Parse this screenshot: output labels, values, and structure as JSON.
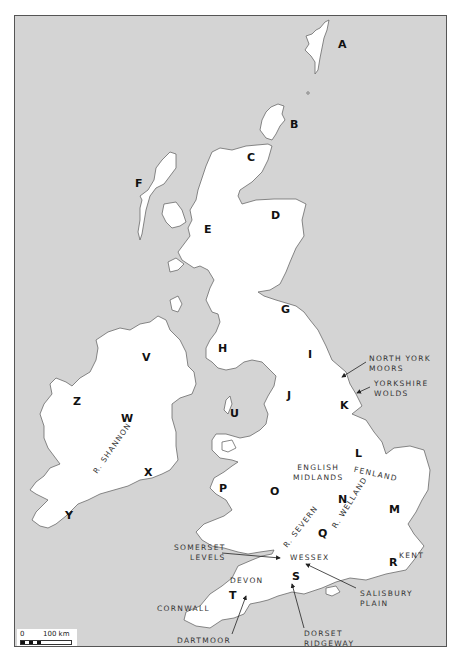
{
  "map": {
    "background_color": "#d4d4d4",
    "land_color": "#ffffff",
    "region_labels": [
      {
        "id": "A",
        "x": 338,
        "y": 44
      },
      {
        "id": "B",
        "x": 290,
        "y": 124
      },
      {
        "id": "C",
        "x": 247,
        "y": 157
      },
      {
        "id": "D",
        "x": 271,
        "y": 215
      },
      {
        "id": "E",
        "x": 204,
        "y": 229
      },
      {
        "id": "F",
        "x": 135,
        "y": 183
      },
      {
        "id": "G",
        "x": 281,
        "y": 304
      },
      {
        "id": "H",
        "x": 218,
        "y": 341
      },
      {
        "id": "I",
        "x": 308,
        "y": 350
      },
      {
        "id": "J",
        "x": 287,
        "y": 389
      },
      {
        "id": "K",
        "x": 340,
        "y": 398
      },
      {
        "id": "L",
        "x": 355,
        "y": 449
      },
      {
        "id": "M",
        "x": 389,
        "y": 504
      },
      {
        "id": "N",
        "x": 338,
        "y": 494
      },
      {
        "id": "O",
        "x": 270,
        "y": 486
      },
      {
        "id": "P",
        "x": 219,
        "y": 483
      },
      {
        "id": "Q",
        "x": 318,
        "y": 528
      },
      {
        "id": "R",
        "x": 389,
        "y": 556
      },
      {
        "id": "S",
        "x": 292,
        "y": 571
      },
      {
        "id": "T",
        "x": 229,
        "y": 590
      },
      {
        "id": "U",
        "x": 230,
        "y": 408
      },
      {
        "id": "V",
        "x": 142,
        "y": 353
      },
      {
        "id": "W",
        "x": 121,
        "y": 413
      },
      {
        "id": "X",
        "x": 144,
        "y": 467
      },
      {
        "id": "Y",
        "x": 65,
        "y": 511
      },
      {
        "id": "Z",
        "x": 73,
        "y": 396
      }
    ],
    "place_labels": [
      {
        "text_lines": [
          "NORTH YORK",
          "MOORS"
        ],
        "x": 369,
        "y": 354
      },
      {
        "text_lines": [
          "YORKSHIRE",
          "WOLDS"
        ],
        "x": 374,
        "y": 379
      },
      {
        "text_lines": [
          "ENGLISH",
          "MIDLANDS"
        ],
        "x": 293,
        "y": 463
      },
      {
        "text_lines": [
          "FENLAND"
        ],
        "x": 355,
        "y": 466
      },
      {
        "text_lines": [
          "SOMERSET",
          "LEVELS"
        ],
        "x": 174,
        "y": 543
      },
      {
        "text_lines": [
          "WESSEX"
        ],
        "x": 290,
        "y": 553
      },
      {
        "text_lines": [
          "KENT"
        ],
        "x": 399,
        "y": 551
      },
      {
        "text_lines": [
          "DEVON"
        ],
        "x": 230,
        "y": 576
      },
      {
        "text_lines": [
          "SALISBURY",
          "PLAIN"
        ],
        "x": 360,
        "y": 589
      },
      {
        "text_lines": [
          "CORNWALL"
        ],
        "x": 157,
        "y": 604
      },
      {
        "text_lines": [
          "DARTMOOR"
        ],
        "x": 177,
        "y": 636
      },
      {
        "text_lines": [
          "DORSET",
          "RIDGEWAY"
        ],
        "x": 304,
        "y": 629
      }
    ],
    "rivers": [
      {
        "name": "R. SHANNON",
        "x": 95,
        "y": 468,
        "angle": -55
      },
      {
        "name": "R. SEVERN",
        "x": 285,
        "y": 542,
        "angle": -52
      },
      {
        "name": "R. WELLAND",
        "x": 334,
        "y": 523,
        "angle": -58
      }
    ],
    "scale_bar": {
      "zero_label": "0",
      "end_label": "100 km"
    }
  }
}
